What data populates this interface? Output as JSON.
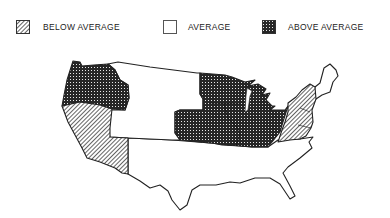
{
  "legend": {
    "items": [
      {
        "key": "below",
        "label": "BELOW AVERAGE",
        "pattern": "diagonal-hatch"
      },
      {
        "key": "average",
        "label": "AVERAGE",
        "pattern": "none"
      },
      {
        "key": "above",
        "label": "ABOVE AVERAGE",
        "pattern": "crosshatch"
      }
    ]
  },
  "map": {
    "title": "",
    "regions": [
      {
        "name": "Pacific Northwest",
        "category": "above"
      },
      {
        "name": "California-Nevada",
        "category": "below"
      },
      {
        "name": "Mountain States",
        "category": "average"
      },
      {
        "name": "Midwest / Great Lakes",
        "category": "above"
      },
      {
        "name": "Mid-Atlantic",
        "category": "below"
      },
      {
        "name": "New England",
        "category": "average"
      },
      {
        "name": "South",
        "category": "average"
      }
    ]
  },
  "colors": {
    "outline": "#222222",
    "background": "#ffffff",
    "fill_dark": "#2a2a2a"
  }
}
